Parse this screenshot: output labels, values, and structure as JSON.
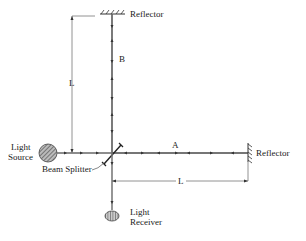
{
  "labels": {
    "reflector_top": "Reflector",
    "reflector_right": "Reflector",
    "beam_a": "A",
    "beam_b": "B",
    "length_vertical": "L",
    "length_horizontal": "L",
    "light_source_line1": "Light",
    "light_source_line2": "Source",
    "beam_splitter": "Beam Splitter",
    "light_receiver_line1": "Light",
    "light_receiver_line2": "Receiver"
  },
  "colors": {
    "beam": "#888888",
    "ink": "#222222"
  }
}
